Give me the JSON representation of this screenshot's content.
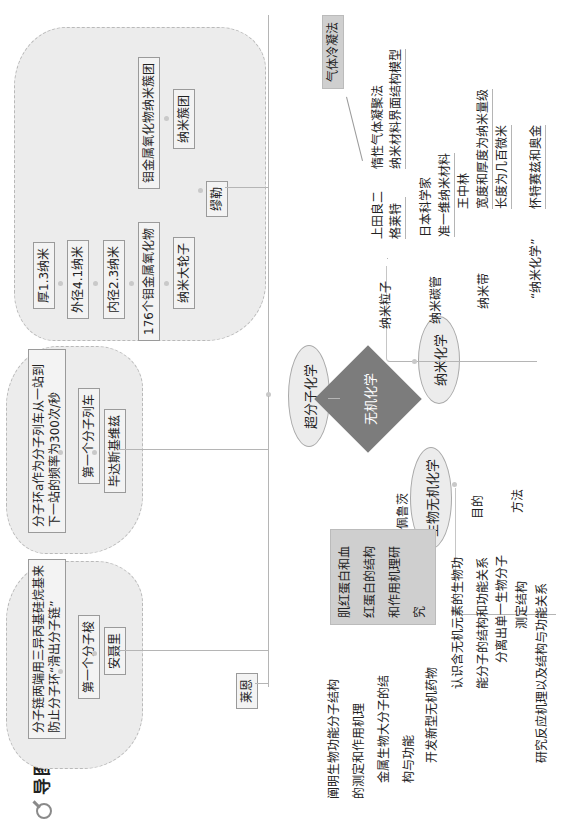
{
  "title": {
    "text": "导图",
    "icon": "magnifier-icon"
  },
  "center": {
    "label": "无机化学",
    "color": "#7c7c7c"
  },
  "branches": {
    "supramolecular": {
      "label": "超分子化学",
      "leftmost": "莱恩",
      "groups": [
        {
          "scientist": "安聂里",
          "achievement": "第一个分子梭",
          "description": "分子链两端用三异丙基硅烷基来防止分子环“滑出分子链”"
        },
        {
          "scientist": "毕达斯基维兹",
          "achievement": "第一个分子列车",
          "description": "分子环a作为分子列车从一站到下一站的频率为300次/秒"
        },
        {
          "scientist": "缪勒",
          "rows": [
            {
              "head": "纳米大轮子",
              "chain": [
                "176个钼金属氧化物",
                "内径2.3纳米",
                "外径4.1纳米",
                "厚1.3纳米"
              ]
            },
            {
              "head": "纳米簇团",
              "chain": [
                "钼金属氧化物纳米簇团"
              ]
            }
          ]
        }
      ]
    },
    "nano": {
      "label": "纳米化学",
      "items": [
        {
          "label": "纳米粒子",
          "people": [
            "上田良二",
            "格莱特"
          ],
          "details": [
            "惰性气体凝聚法",
            "纳米材料界面结构模型"
          ],
          "callout": "气体冷凝法"
        },
        {
          "label": "纳米碳管",
          "people": [
            "日本科学家"
          ],
          "details": [
            "准一维纳米材料"
          ]
        },
        {
          "label": "纳米带",
          "people": [
            "王中林"
          ],
          "details": [
            "宽度和厚度为纳米量级",
            "长度为几百微米"
          ]
        },
        {
          "label": "“纳米化学”",
          "people": [],
          "details": [
            "怀特赛兹和奥金"
          ]
        }
      ]
    },
    "bio": {
      "label": "生物无机化学",
      "items": [
        {
          "label": "佩鲁茨",
          "box": "肌红蛋白和血红蛋白的结构和作用机理研究",
          "subs": [
            "阐明生物功能分子结构的测定和作用机理",
            "金属生物大分子的结构与功能",
            "开发新型无机药物"
          ]
        },
        {
          "label": "目的",
          "subs": [
            "认识含无机元素的生物功能分子的结构和功能关系"
          ]
        },
        {
          "label": "方法",
          "subs": [
            "分离出单一生物分子",
            "测定结构",
            "研究反应机理以及结构与功能关系"
          ]
        }
      ]
    }
  }
}
